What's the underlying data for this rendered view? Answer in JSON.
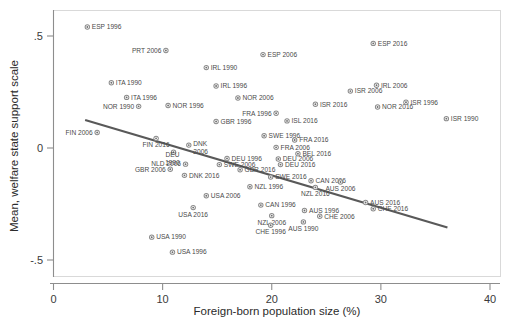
{
  "chart_data": {
    "type": "scatter",
    "title": "",
    "xlabel": "Foreign-born population size (%)",
    "ylabel": "Mean, welfare state support scale",
    "xlim": [
      0,
      40
    ],
    "ylim": [
      -0.62,
      0.6
    ],
    "xticks": [
      "0",
      "10",
      "20",
      "30",
      "40"
    ],
    "xtick_values": [
      0,
      10,
      20,
      30,
      40
    ],
    "yticks": [
      ".5",
      "0",
      "-.5"
    ],
    "ytick_values": [
      0.5,
      0,
      -0.5
    ],
    "grid": false,
    "legend": "none",
    "fitline": {
      "label": "linear fit",
      "x0": 2.9,
      "y0": 0.125,
      "x1": 36.1,
      "y1": -0.355,
      "color": "#595959"
    },
    "points": [
      {
        "label": "ESP 1996",
        "x": 3.1,
        "y": 0.54,
        "lpos": "right"
      },
      {
        "label": "PRT 2006",
        "x": 10.3,
        "y": 0.435,
        "lpos": "left"
      },
      {
        "label": "ESP 2016",
        "x": 29.3,
        "y": 0.467,
        "lpos": "right"
      },
      {
        "label": "ESP 2006",
        "x": 19.2,
        "y": 0.417,
        "lpos": "right"
      },
      {
        "label": "IRL 1990",
        "x": 14.0,
        "y": 0.359,
        "lpos": "right"
      },
      {
        "label": "ITA 1990",
        "x": 5.3,
        "y": 0.291,
        "lpos": "right"
      },
      {
        "label": "IRL 1996",
        "x": 14.9,
        "y": 0.277,
        "lpos": "right"
      },
      {
        "label": "IRL 2006",
        "x": 29.6,
        "y": 0.28,
        "lpos": "right"
      },
      {
        "label": "ITA 1996",
        "x": 6.7,
        "y": 0.226,
        "lpos": "right"
      },
      {
        "label": "NOR 2006",
        "x": 16.9,
        "y": 0.223,
        "lpos": "right"
      },
      {
        "label": "NOR 1990",
        "x": 7.8,
        "y": 0.186,
        "lpos": "left"
      },
      {
        "label": "NOR 1996",
        "x": 10.5,
        "y": 0.19,
        "lpos": "right"
      },
      {
        "label": "NOR 2016",
        "x": 29.7,
        "y": 0.183,
        "lpos": "right"
      },
      {
        "label": "FRA 1996",
        "x": 20.4,
        "y": 0.155,
        "lpos": "left"
      },
      {
        "label": "GBR 1996",
        "x": 14.9,
        "y": 0.118,
        "lpos": "right"
      },
      {
        "label": "ISL 2016",
        "x": 21.4,
        "y": 0.121,
        "lpos": "right"
      },
      {
        "label": "FIN 2006",
        "x": 4.0,
        "y": 0.069,
        "lpos": "left"
      },
      {
        "label": "SWE 1996",
        "x": 19.3,
        "y": 0.055,
        "lpos": "right"
      },
      {
        "label": "FIN 2016",
        "x": 9.4,
        "y": 0.043,
        "lpos": "below"
      },
      {
        "label": "FRA 2016",
        "x": 22.1,
        "y": 0.036,
        "lpos": "right"
      },
      {
        "label": "DNK 2006",
        "x": 12.4,
        "y": 0.013,
        "lpos": "right2"
      },
      {
        "label": "FRA 2006",
        "x": 20.4,
        "y": 0.003,
        "lpos": "right"
      },
      {
        "label": "DEU 1990",
        "x": 11.0,
        "y": -0.019,
        "lpos": "below2"
      },
      {
        "label": "BEL 2016",
        "x": 22.4,
        "y": -0.026,
        "lpos": "right"
      },
      {
        "label": "DEU 1996",
        "x": 15.9,
        "y": -0.047,
        "lpos": "right"
      },
      {
        "label": "DEU 2006",
        "x": 20.6,
        "y": -0.049,
        "lpos": "right"
      },
      {
        "label": "NLD 2006",
        "x": 12.1,
        "y": -0.072,
        "lpos": "left"
      },
      {
        "label": "SWE 2006",
        "x": 15.2,
        "y": -0.074,
        "lpos": "right"
      },
      {
        "label": "DEU 2016",
        "x": 20.8,
        "y": -0.074,
        "lpos": "right"
      },
      {
        "label": "GBR 2006",
        "x": 10.7,
        "y": -0.095,
        "lpos": "left"
      },
      {
        "label": "GBR 2016",
        "x": 17.1,
        "y": -0.097,
        "lpos": "right"
      },
      {
        "label": "DNK 2016",
        "x": 12.0,
        "y": -0.122,
        "lpos": "right"
      },
      {
        "label": "SWE 2016",
        "x": 19.9,
        "y": -0.13,
        "lpos": "right"
      },
      {
        "label": "CAN 2006",
        "x": 23.6,
        "y": -0.146,
        "lpos": "right"
      },
      {
        "label": "AUS 2006",
        "x": 26.3,
        "y": -0.152,
        "lpos": "below"
      },
      {
        "label": "NZL 1996",
        "x": 18.0,
        "y": -0.173,
        "lpos": "right"
      },
      {
        "label": "NZL 2016",
        "x": 24.0,
        "y": -0.176,
        "lpos": "below"
      },
      {
        "label": "USA 2006",
        "x": 14.0,
        "y": -0.213,
        "lpos": "right"
      },
      {
        "label": "AUS 2016",
        "x": 28.6,
        "y": -0.243,
        "lpos": "right"
      },
      {
        "label": "CAN 1996",
        "x": 19.0,
        "y": -0.255,
        "lpos": "right"
      },
      {
        "label": "USA 2016",
        "x": 12.8,
        "y": -0.266,
        "lpos": "below"
      },
      {
        "label": "CHE 2016",
        "x": 29.3,
        "y": -0.271,
        "lpos": "right"
      },
      {
        "label": "AUS 1996",
        "x": 23.0,
        "y": -0.279,
        "lpos": "right"
      },
      {
        "label": "NZL 2006",
        "x": 20.0,
        "y": -0.302,
        "lpos": "below"
      },
      {
        "label": "CHE 2006",
        "x": 24.4,
        "y": -0.305,
        "lpos": "right"
      },
      {
        "label": "AUS 1990",
        "x": 22.9,
        "y": -0.33,
        "lpos": "below"
      },
      {
        "label": "CHE 1996",
        "x": 19.9,
        "y": -0.345,
        "lpos": "below"
      },
      {
        "label": "USA 1990",
        "x": 9.0,
        "y": -0.398,
        "lpos": "right"
      },
      {
        "label": "USA 1996",
        "x": 10.9,
        "y": -0.465,
        "lpos": "right"
      },
      {
        "label": "ISR 2006",
        "x": 27.2,
        "y": 0.254,
        "lpos": "right"
      },
      {
        "label": "ISR 1996",
        "x": 32.3,
        "y": 0.204,
        "lpos": "right"
      },
      {
        "label": "ISR 2016",
        "x": 24.0,
        "y": 0.195,
        "lpos": "right"
      },
      {
        "label": "ISR 1990",
        "x": 36.0,
        "y": 0.131,
        "lpos": "right"
      }
    ]
  }
}
